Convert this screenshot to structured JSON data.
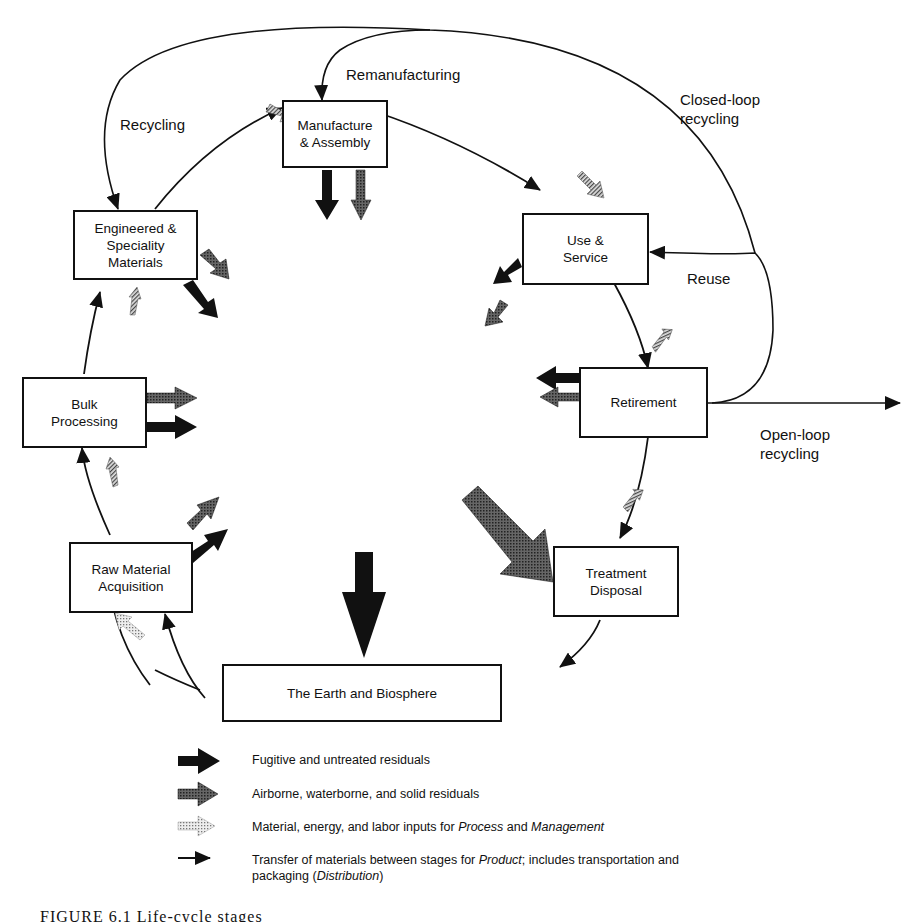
{
  "diagram": {
    "nodes": {
      "manufacture": "Manufacture & Assembly",
      "manufacture_l1": "Manufacture",
      "manufacture_l2": "& Assembly",
      "use_l1": "Use &",
      "use_l2": "Service",
      "retirement": "Retirement",
      "treatment_l1": "Treatment",
      "treatment_l2": "Disposal",
      "earth": "The Earth and Biosphere",
      "raw_l1": "Raw Material",
      "raw_l2": "Acquisition",
      "bulk_l1": "Bulk",
      "bulk_l2": "Processing",
      "eng_l1": "Engineered &",
      "eng_l2": "Speciality",
      "eng_l3": "Materials"
    },
    "flow_labels": {
      "recycling": "Recycling",
      "remanufacturing": "Remanufacturing",
      "closed_loop_l1": "Closed-loop",
      "closed_loop_l2": "recycling",
      "reuse": "Reuse",
      "open_loop_l1": "Open-loop",
      "open_loop_l2": "recycling"
    },
    "edges": [
      {
        "from": "Raw Material Acquisition",
        "to": "Bulk Processing"
      },
      {
        "from": "Bulk Processing",
        "to": "Engineered & Speciality Materials"
      },
      {
        "from": "Engineered & Speciality Materials",
        "to": "Manufacture & Assembly"
      },
      {
        "from": "Manufacture & Assembly",
        "to": "Use & Service"
      },
      {
        "from": "Use & Service",
        "to": "Retirement"
      },
      {
        "from": "Retirement",
        "to": "Treatment Disposal"
      },
      {
        "from": "Treatment Disposal",
        "to": "The Earth and Biosphere"
      },
      {
        "from": "The Earth and Biosphere",
        "to": "Raw Material Acquisition"
      },
      {
        "from": "Retirement",
        "to": "Use & Service",
        "label": "Reuse"
      },
      {
        "from": "Retirement",
        "to": "Manufacture & Assembly",
        "label": "Remanufacturing"
      },
      {
        "from": "Retirement",
        "to": "Engineered & Speciality Materials",
        "label": "Recycling / Closed-loop recycling"
      },
      {
        "from": "Retirement",
        "to": "outside",
        "label": "Open-loop recycling"
      }
    ]
  },
  "legend": {
    "items": [
      {
        "type": "fugitive",
        "text": "Fugitive and untreated residuals"
      },
      {
        "type": "residuals",
        "text": "Airborne, waterborne, and solid residuals"
      },
      {
        "type": "inputs",
        "text_a": "Material, energy, and labor inputs for ",
        "text_b": "Process",
        "text_c": " and ",
        "text_d": "Management"
      },
      {
        "type": "transfer",
        "text_a": "Transfer of materials between stages for ",
        "text_b": "Product",
        "text_c": "; includes transportation and",
        "text_d": "packaging (",
        "text_e": "Distribution",
        "text_f": ")"
      }
    ]
  },
  "caption": "FIGURE 6.1 Life-cycle stages"
}
